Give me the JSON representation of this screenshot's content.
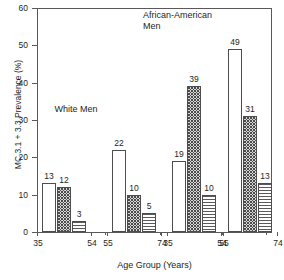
{
  "chart_data": {
    "type": "bar",
    "title": "",
    "xlabel": "Age Group (Years)",
    "ylabel": "MC 3.1 + 3.3 Prevalence (%)",
    "ylim": [
      0,
      60
    ],
    "ytick_labels": [
      "0",
      "10",
      "20",
      "30",
      "40",
      "50",
      "60"
    ],
    "ytick_values": [
      0,
      10,
      20,
      30,
      40,
      50,
      60
    ],
    "grid": false,
    "legend": "none",
    "group_captions": [
      {
        "id": "white-men",
        "line1": "White Men",
        "line2": ""
      },
      {
        "id": "african-american-men",
        "line1": "African-American",
        "line2": "Men"
      }
    ],
    "groups": [
      {
        "population": "White Men",
        "age_group": "35 54",
        "tick_labels": [
          "35",
          "54"
        ],
        "bars": [
          {
            "value": 13,
            "label": "13",
            "pattern": "open"
          },
          {
            "value": 12,
            "label": "12",
            "pattern": "dots"
          },
          {
            "value": 3,
            "label": "3",
            "pattern": "hlines"
          }
        ]
      },
      {
        "population": "White Men",
        "age_group": "55 74",
        "tick_labels": [
          "55",
          "74"
        ],
        "bars": [
          {
            "value": 22,
            "label": "22",
            "pattern": "open"
          },
          {
            "value": 10,
            "label": "10",
            "pattern": "dots"
          },
          {
            "value": 5,
            "label": "5",
            "pattern": "hlines"
          }
        ]
      },
      {
        "population": "African-American Men",
        "age_group": "35 54",
        "tick_labels": [
          "35",
          "54"
        ],
        "bars": [
          {
            "value": 19,
            "label": "19",
            "pattern": "open"
          },
          {
            "value": 39,
            "label": "39",
            "pattern": "dots"
          },
          {
            "value": 10,
            "label": "10",
            "pattern": "hlines"
          }
        ]
      },
      {
        "population": "African-American Men",
        "age_group": "55 74",
        "tick_labels": [
          "55",
          "74"
        ],
        "bars": [
          {
            "value": 49,
            "label": "49",
            "pattern": "open"
          },
          {
            "value": 31,
            "label": "31",
            "pattern": "dots"
          },
          {
            "value": 13,
            "label": "13",
            "pattern": "hlines"
          }
        ]
      }
    ],
    "colors": {
      "axis": "#59595b",
      "text": "#231f20",
      "bar_outline": "#4d4d4f",
      "bar_open_fill": "#ffffff",
      "bar_dots_fill": "#d9d9d9",
      "bar_hlines_fill": "#ffffff"
    }
  }
}
